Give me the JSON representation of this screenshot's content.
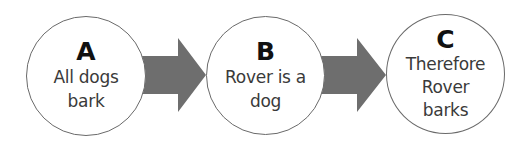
{
  "diagram": {
    "type": "flow",
    "direction": "left-to-right",
    "colors": {
      "arrow_fill": "#6e6e6e",
      "circle_stroke": "#6a6a6a",
      "circle_fill": "#ffffff",
      "letter_color": "#111111",
      "text_color": "#3a3a3a"
    },
    "nodes": [
      {
        "id": "A",
        "letter": "A",
        "lines": [
          "All dogs",
          "bark"
        ]
      },
      {
        "id": "B",
        "letter": "B",
        "lines": [
          "Rover is a",
          "dog"
        ]
      },
      {
        "id": "C",
        "letter": "C",
        "lines": [
          "Therefore",
          "Rover",
          "barks"
        ]
      }
    ],
    "edges": [
      {
        "from": "A",
        "to": "B"
      },
      {
        "from": "B",
        "to": "C"
      }
    ]
  }
}
